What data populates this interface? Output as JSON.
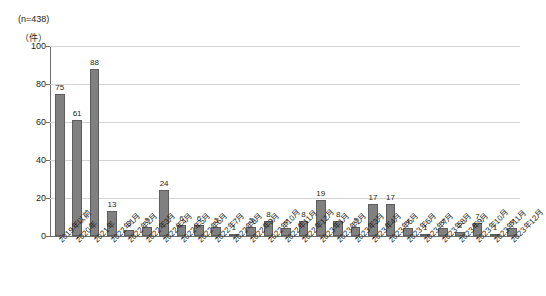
{
  "header": {
    "sample_note": "(n=438)",
    "unit_label": "（件）"
  },
  "chart_data": {
    "type": "bar",
    "title": "",
    "subtitle": "",
    "xlabel": "",
    "ylabel": "（件）",
    "ylim": [
      0,
      100
    ],
    "ytick_values": [
      0,
      20,
      40,
      60,
      80,
      100
    ],
    "ytick_labels": [
      "0",
      "20",
      "40",
      "60",
      "80",
      "100"
    ],
    "grid": true,
    "legend": false,
    "legend_position": "none",
    "bar_color": "#808080",
    "bar_edge_color": "#5d5d5d",
    "grid_color": "#d4d4d4",
    "axis_color": "#6e6e6e",
    "sample_size": 438,
    "categories": [
      "2019年以前",
      "2020年",
      "2021年",
      "2022年1月",
      "2022年2月",
      "2022年3月",
      "2022年4月",
      "2022年5月",
      "2022年6月",
      "2022年7月",
      "2022年8月",
      "2022年9月",
      "2022年10月",
      "2022年11月",
      "2022年12月",
      "2023年1月",
      "2023年2月",
      "2023年3月",
      "2023年4月",
      "2023年5月",
      "2023年6月",
      "2023年7月",
      "2023年8月",
      "2023年9月",
      "2023年10月",
      "2023年11月",
      "2023年12月"
    ],
    "values": [
      75,
      61,
      88,
      13,
      3,
      5,
      24,
      6,
      6,
      5,
      1,
      5,
      8,
      4,
      8,
      19,
      8,
      5,
      17,
      17,
      4,
      1,
      4,
      2,
      7,
      1,
      4
    ],
    "value_labels": [
      "75",
      "61",
      "88",
      "13",
      "3",
      "5",
      "24",
      "6",
      "6",
      "5",
      "1",
      "5",
      "8",
      "4",
      "8",
      "19",
      "8",
      "5",
      "17",
      "17",
      "4",
      "1",
      "4",
      "2",
      "7",
      "1",
      "4"
    ]
  }
}
